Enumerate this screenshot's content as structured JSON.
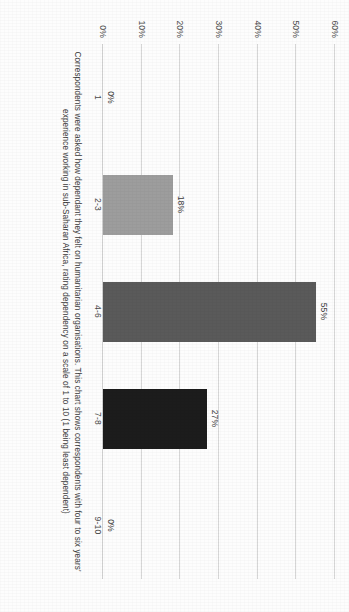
{
  "chart_data": {
    "type": "bar",
    "orientation": "vertical",
    "categories": [
      "1",
      "2-3",
      "4-6",
      "7-8",
      "9-10"
    ],
    "values": [
      0,
      18,
      55,
      27,
      0
    ],
    "value_labels": [
      "0%",
      "18%",
      "55%",
      "27%",
      "0%"
    ],
    "bar_colors": [
      "#b3b3b3",
      "#9d9d9d",
      "#5a5a5a",
      "#1c1c1c",
      "#b3b3b3"
    ],
    "title": "",
    "subtitle": "",
    "xlabel": "",
    "ylabel": "",
    "ylim": [
      0,
      60
    ],
    "yticks": [
      0,
      10,
      20,
      30,
      40,
      50,
      60
    ],
    "ytick_labels": [
      "0%",
      "10%",
      "20%",
      "30%",
      "40%",
      "50%",
      "60%"
    ],
    "grid": true,
    "legend": false,
    "caption_line1": "Correspondents were asked how dependant they felt on humanitarian organisations. This chart shows correspondents with four to six years'",
    "caption_line2": "experience working in sub-Saharan Africa, rating dependency on a scale of 1 to 10 (1 being least dependent)"
  },
  "page": {
    "orientation": "rotated-90",
    "background": "#fdfdfd",
    "gridline_color": "#d7d7d7",
    "text_color": "#3b3b3b"
  }
}
